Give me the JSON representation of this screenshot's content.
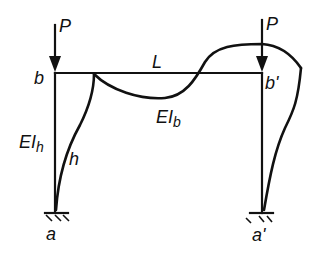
{
  "diagram": {
    "type": "portal-frame-buckling",
    "colors": {
      "ink": "#111111",
      "background": "#ffffff"
    },
    "loads": [
      {
        "id": "load-left",
        "symbol": "P",
        "node": "b"
      },
      {
        "id": "load-right",
        "symbol": "P",
        "node": "b'"
      }
    ],
    "nodes": {
      "b": "b",
      "b_prime": "b'",
      "a": "a",
      "a_prime": "a'"
    },
    "members": {
      "beam_length": "L",
      "beam_stiffness_E": "EI",
      "beam_stiffness_sub": "b",
      "column_stiffness_E": "EI",
      "column_stiffness_sub": "h",
      "column_height": "h"
    },
    "supports": [
      "fixed",
      "fixed"
    ]
  }
}
